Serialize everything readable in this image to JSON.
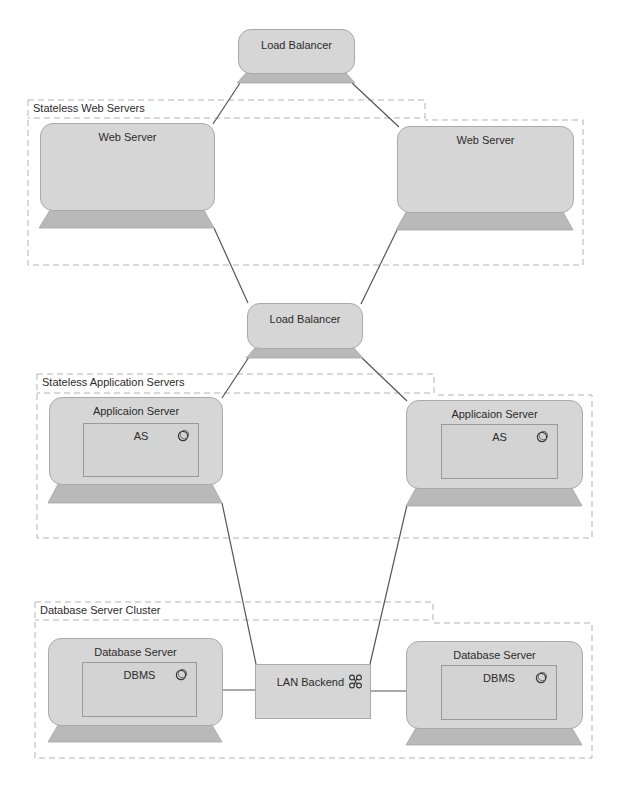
{
  "diagram": {
    "type": "deployment-architecture",
    "colors": {
      "node_fill": "#d6d6d6",
      "node_border": "#a9a9a9",
      "base_fill": "#b9b9b9",
      "group_border": "#b3b3b3",
      "connector": "#555555",
      "text": "#2b2b2b"
    },
    "load_balancers": [
      {
        "label": "Load Balancer"
      },
      {
        "label": "Load Balancer"
      }
    ],
    "groups": [
      {
        "label": "Stateless Web Servers",
        "nodes": [
          {
            "label": "Web Server"
          },
          {
            "label": "Web Server"
          }
        ]
      },
      {
        "label": "Stateless Application Servers",
        "nodes": [
          {
            "label": "Applicaion Server",
            "component": "AS",
            "component_icon": "component-icon"
          },
          {
            "label": "Applicaion Server",
            "component": "AS",
            "component_icon": "component-icon"
          }
        ]
      },
      {
        "label": "Database Server Cluster",
        "nodes": [
          {
            "label": "Database Server",
            "component": "DBMS",
            "component_icon": "component-icon"
          },
          {
            "label": "Database Server",
            "component": "DBMS",
            "component_icon": "component-icon"
          }
        ]
      }
    ],
    "network": {
      "label": "LAN Backend",
      "icon": "network-icon"
    },
    "connections": [
      [
        "Load Balancer (top)",
        "Web Server (left)"
      ],
      [
        "Load Balancer (top)",
        "Web Server (right)"
      ],
      [
        "Web Server (left)",
        "Load Balancer (middle)"
      ],
      [
        "Web Server (right)",
        "Load Balancer (middle)"
      ],
      [
        "Load Balancer (middle)",
        "Applicaion Server (left)"
      ],
      [
        "Load Balancer (middle)",
        "Applicaion Server (right)"
      ],
      [
        "Applicaion Server (left)",
        "LAN Backend"
      ],
      [
        "Applicaion Server (right)",
        "LAN Backend"
      ],
      [
        "Database Server (left)",
        "LAN Backend"
      ],
      [
        "LAN Backend",
        "Database Server (right)"
      ]
    ]
  }
}
